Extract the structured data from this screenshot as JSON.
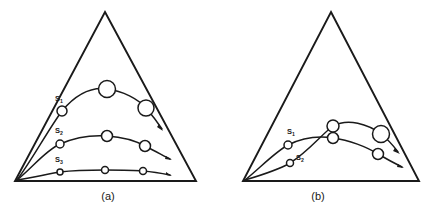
{
  "figure": {
    "title": "",
    "background_color": "#ffffff",
    "stroke_color": "#1a1a1a",
    "node_fill_color": "#ffffff"
  },
  "panels": [
    {
      "id": "a",
      "caption": "(a)",
      "triangle": {
        "apex": [
          105,
          12
        ],
        "left": [
          15,
          181
        ],
        "right": [
          196,
          181
        ]
      },
      "trajectories": [
        {
          "label": "S₁",
          "label_text": "S",
          "label_sub": "1",
          "label_pos": [
            62,
            99
          ],
          "start": [
            17,
            180
          ],
          "nodes": [
            {
              "cx": 62,
              "cy": 111,
              "r": 5.0
            },
            {
              "cx": 107,
              "cy": 89,
              "r": 8.5
            },
            {
              "cx": 146,
              "cy": 108,
              "r": 8.0
            }
          ],
          "arrow_tip": [
            164,
            131
          ]
        },
        {
          "label": "S₂",
          "label_text": "S",
          "label_sub": "2",
          "label_pos": [
            62,
            131
          ],
          "start": [
            17,
            180
          ],
          "nodes": [
            {
              "cx": 60,
              "cy": 144,
              "r": 4.0
            },
            {
              "cx": 107,
              "cy": 136,
              "r": 5.5
            },
            {
              "cx": 145,
              "cy": 146,
              "r": 5.5
            }
          ],
          "arrow_tip": [
            172,
            160
          ]
        },
        {
          "label": "S₃",
          "label_text": "S",
          "label_sub": "3",
          "label_pos": [
            62,
            160
          ],
          "start": [
            17,
            180
          ],
          "nodes": [
            {
              "cx": 60,
              "cy": 172,
              "r": 3.0
            },
            {
              "cx": 105,
              "cy": 170,
              "r": 3.5
            },
            {
              "cx": 143,
              "cy": 171,
              "r": 3.5
            }
          ],
          "arrow_tip": [
            172,
            176
          ]
        }
      ]
    },
    {
      "id": "b",
      "caption": "(b)",
      "triangle": {
        "apex": [
          331,
          12
        ],
        "left": [
          243,
          181
        ],
        "right": [
          419,
          181
        ]
      },
      "trajectories": [
        {
          "label": "S₁",
          "label_text": "S",
          "label_sub": "1",
          "label_pos": [
            294,
            132
          ],
          "start": [
            245,
            180
          ],
          "nodes": [
            {
              "cx": 288,
              "cy": 145,
              "r": 4.0
            },
            {
              "cx": 333,
              "cy": 138,
              "r": 5.5
            },
            {
              "cx": 378,
              "cy": 154,
              "r": 5.5
            }
          ],
          "arrow_tip": [
            404,
            168
          ]
        },
        {
          "label": "S₂",
          "label_text": "S",
          "label_sub": "2",
          "label_pos": [
            296,
            157
          ],
          "start": [
            245,
            180
          ],
          "nodes": [
            {
              "cx": 290,
              "cy": 163,
              "r": 3.5
            },
            {
              "cx": 333,
              "cy": 126,
              "r": 6.0
            },
            {
              "cx": 381,
              "cy": 134,
              "r": 8.5
            }
          ],
          "arrow_tip": [
            400,
            154
          ]
        }
      ]
    }
  ]
}
